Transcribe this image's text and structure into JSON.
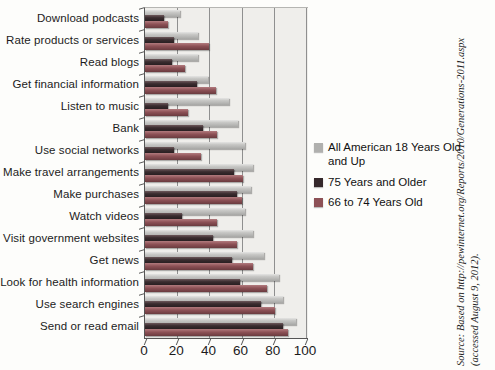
{
  "chart_data": {
    "type": "bar",
    "orientation": "horizontal",
    "title": "",
    "xlabel": "",
    "ylabel": "",
    "xlim": [
      0,
      100
    ],
    "x_ticks": [
      0,
      20,
      40,
      60,
      80,
      100
    ],
    "grid": "vertical",
    "legend_position": "right",
    "categories": [
      "Download podcasts",
      "Rate products or services",
      "Read blogs",
      "Get financial information",
      "Listen to music",
      "Bank",
      "Use social networks",
      "Make travel arrangements",
      "Make purchases",
      "Watch videos",
      "Visit government websites",
      "Get news",
      "Look for health information",
      "Use search engines",
      "Send or read email"
    ],
    "series": [
      {
        "name": "All American 18 Years Old and Up",
        "color": "#b0b0ae",
        "values": [
          22,
          33,
          33,
          39,
          52,
          58,
          62,
          67,
          66,
          62,
          67,
          74,
          83,
          86,
          94
        ]
      },
      {
        "name": "75 Years and Older",
        "color": "#35282b",
        "values": [
          12,
          18,
          17,
          32,
          14,
          36,
          18,
          55,
          57,
          23,
          42,
          54,
          59,
          72,
          86
        ]
      },
      {
        "name": "66 to 74 Years Old",
        "color": "#8d5156",
        "values": [
          14,
          40,
          25,
          44,
          27,
          45,
          35,
          61,
          60,
          45,
          57,
          67,
          76,
          81,
          89
        ]
      }
    ]
  },
  "source_note": {
    "line1": "Source: Based on http://pewinternet.org/Reports/2010/Generations-2011.aspx",
    "line2": "(accessed August 9, 2012)."
  },
  "colors": {
    "gridline": "#8f8f8f",
    "axis": "#555555",
    "plot_bg": "#efeeeb",
    "page_bg": "#fdfdfb"
  }
}
